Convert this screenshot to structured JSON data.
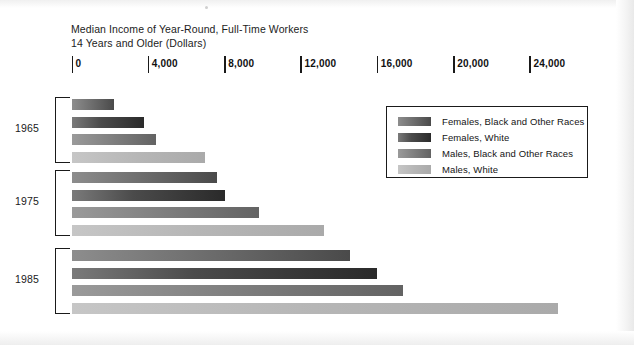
{
  "figure": {
    "title_line_1": "Median Income of Year-Round, Full-Time Workers",
    "title_line_2": "14 Years and Older (Dollars)"
  },
  "axis": {
    "tick_labels": [
      "0",
      "4,000",
      "8,000",
      "12,000",
      "16,000",
      "20,000",
      "24,000"
    ],
    "tick_values": [
      0,
      4000,
      8000,
      12000,
      16000,
      20000,
      24000
    ]
  },
  "groups": [
    {
      "year": "1965"
    },
    {
      "year": "1975"
    },
    {
      "year": "1985"
    }
  ],
  "legend": {
    "entries": [
      {
        "label": "Females, Black and Other Races",
        "color": "#6f6f6f"
      },
      {
        "label": "Females, White",
        "color": "#3a3a3a"
      },
      {
        "label": "Males, Black and Other Races",
        "color": "#7e7e7e"
      },
      {
        "label": "Males, White",
        "color": "#b6b6b6"
      }
    ]
  },
  "chart_data": {
    "type": "bar",
    "orientation": "horizontal",
    "title": "Median Income of Year-Round, Full-Time Workers 14 Years and Older (Dollars)",
    "xlabel": "Dollars",
    "ylabel": "",
    "xlim": [
      0,
      26000
    ],
    "grid": false,
    "legend_position": "inside-right",
    "categories": [
      "1965",
      "1975",
      "1985"
    ],
    "series": [
      {
        "name": "Females, Black and Other Races",
        "color": "#6f6f6f",
        "values": [
          2250,
          7650,
          14600
        ]
      },
      {
        "name": "Females, White",
        "color": "#3a3a3a",
        "values": [
          3820,
          8020,
          16000
        ]
      },
      {
        "name": "Males, Black and Other Races",
        "color": "#7e7e7e",
        "values": [
          4450,
          9850,
          17350
        ]
      },
      {
        "name": "Males, White",
        "color": "#b6b6b6",
        "values": [
          6970,
          13250,
          25500
        ]
      }
    ],
    "axis_ticks": [
      0,
      4000,
      8000,
      12000,
      16000,
      20000,
      24000
    ],
    "axis_tick_labels": [
      "0",
      "4,000",
      "8,000",
      "12,000",
      "16,000",
      "20,000",
      "24,000"
    ]
  },
  "_layout": {
    "x0_px": 71.5,
    "px_per_dollar": 0.019083,
    "group_tops_px": [
      99,
      172,
      250
    ],
    "bar_pitch_px": 17.5,
    "tick_spacing_px": 76.33
  }
}
